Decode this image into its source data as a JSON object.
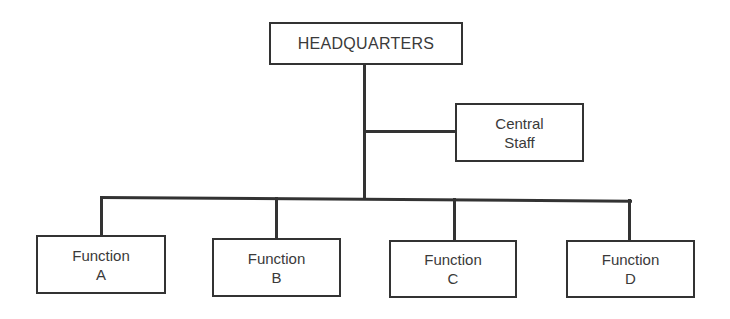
{
  "chart_title": "",
  "headquarters": {
    "label": "HEADQUARTERS"
  },
  "central_staff": {
    "line1": "Central",
    "line2": "Staff"
  },
  "functions": [
    {
      "line1": "Function",
      "line2": "A"
    },
    {
      "line1": "Function",
      "line2": "B"
    },
    {
      "line1": "Function",
      "line2": "C"
    },
    {
      "line1": "Function",
      "line2": "D"
    }
  ],
  "colors": {
    "line": "#333333",
    "text": "#3a3a3a",
    "background": "#ffffff"
  }
}
